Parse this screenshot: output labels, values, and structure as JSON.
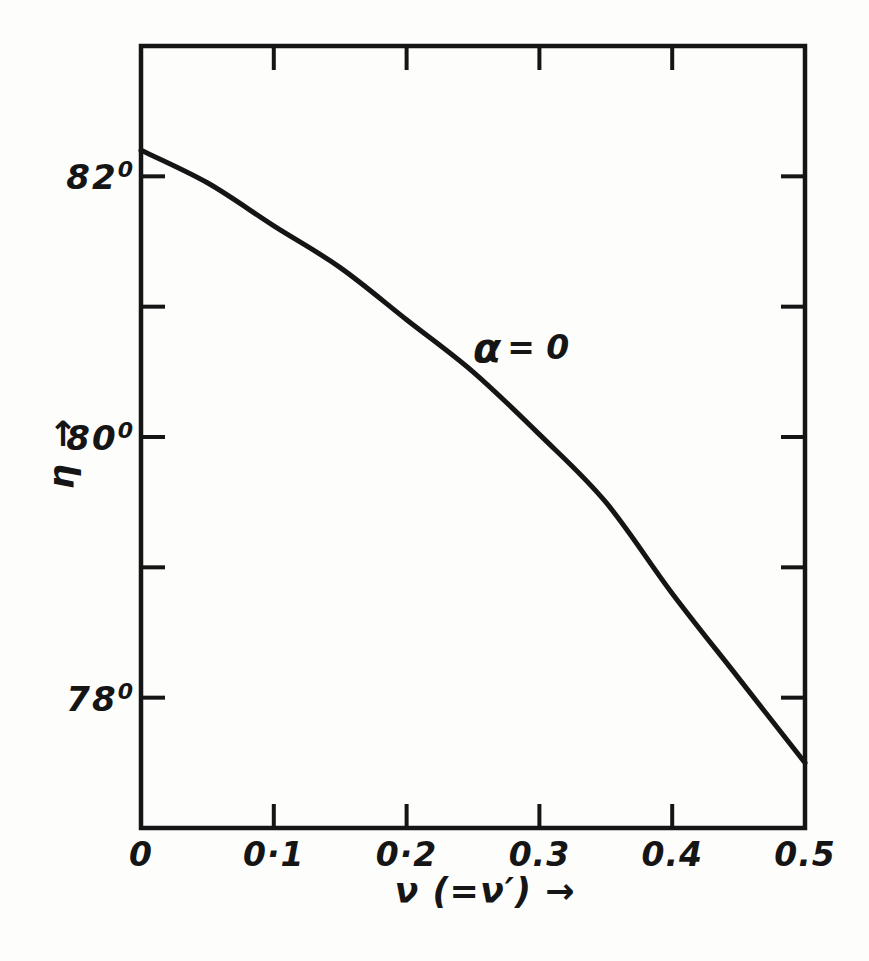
{
  "figure": {
    "background_color": "#fdfdfc",
    "ink_color": "#151515"
  },
  "chart_data": {
    "type": "line",
    "title": "",
    "xlabel": "ν (=ν′) →",
    "ylabel": "η →",
    "xlim": [
      0,
      0.5
    ],
    "ylim": [
      77,
      83
    ],
    "grid": false,
    "legend": "none",
    "frame": "full-box-with-inward-mirrored-ticks",
    "x_ticks": [
      0.1,
      0.2,
      0.3,
      0.4
    ],
    "x_tick_labels": [
      {
        "value": 0,
        "label": "0"
      },
      {
        "value": 0.1,
        "label": "0·1"
      },
      {
        "value": 0.2,
        "label": "0·2"
      },
      {
        "value": 0.3,
        "label": "0.3"
      },
      {
        "value": 0.4,
        "label": "0.4"
      },
      {
        "value": 0.5,
        "label": "0.5"
      }
    ],
    "y_ticks": [
      78,
      79,
      80,
      81,
      82
    ],
    "y_tick_labels": [
      {
        "value": 82,
        "label": "82",
        "degree": "0"
      },
      {
        "value": 80,
        "label": "80",
        "degree": "0"
      },
      {
        "value": 78,
        "label": "78",
        "degree": "0"
      }
    ],
    "series": [
      {
        "name": "α = 0",
        "x": [
          0,
          0.05,
          0.1,
          0.15,
          0.2,
          0.25,
          0.3,
          0.35,
          0.4,
          0.45,
          0.5
        ],
        "y": [
          82.2,
          81.95,
          81.62,
          81.3,
          80.9,
          80.5,
          80.02,
          79.5,
          78.8,
          78.15,
          77.5
        ]
      }
    ],
    "annotation": {
      "symbol": "α",
      "rest": "= 0",
      "x": 0.25,
      "y": 80.68
    }
  }
}
